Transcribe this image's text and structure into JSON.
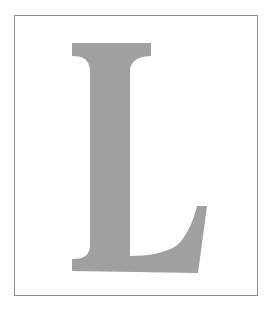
{
  "figure": {
    "letter": "L",
    "letter_color": "#a0a0a0",
    "border_color": "#8c8c8c",
    "background_color": "#ffffff"
  }
}
